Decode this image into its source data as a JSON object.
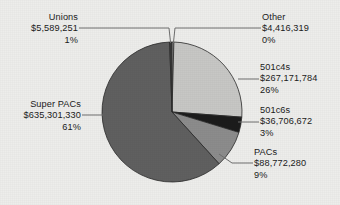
{
  "background_color": "#ededeb",
  "text_color": "#1b1b1b",
  "chart_data": {
    "type": "pie",
    "title": "",
    "subtitle": "",
    "xlabel": "",
    "ylabel": "",
    "legend_position": "none",
    "grid": false,
    "labels_show_value": true,
    "labels_show_percent": true,
    "total_value": "$1,037,957,836",
    "categories": [
      "Unions",
      "Other",
      "501c4s",
      "501c6s",
      "PACs",
      "Super PACs"
    ],
    "values": [
      5589251,
      4416319,
      267171784,
      36706672,
      88772280,
      635301330
    ],
    "percents": [
      1,
      0,
      26,
      3,
      9,
      61
    ],
    "colors": [
      "#3c3c3c",
      "#d6d6d4",
      "#c7c7c5",
      "#1c1c1c",
      "#8c8c8c",
      "#606060"
    ],
    "slices": [
      {
        "name": "other",
        "label": "Other",
        "value_text": "$4,416,319",
        "percent_text": "0%",
        "percent": 0.43,
        "color": "#d6d6d4"
      },
      {
        "name": "501c4s",
        "label": "501c4s",
        "value_text": "$267,171,784",
        "percent_text": "26%",
        "percent": 25.74,
        "color": "#c7c7c5"
      },
      {
        "name": "501c6s",
        "label": "501c6s",
        "value_text": "$36,706,672",
        "percent_text": "3%",
        "percent": 3.54,
        "color": "#1c1c1c"
      },
      {
        "name": "pacs",
        "label": "PACs",
        "value_text": "$88,772,280",
        "percent_text": "9%",
        "percent": 8.55,
        "color": "#8c8c8c"
      },
      {
        "name": "super-pacs",
        "label": "Super PACs",
        "value_text": "$635,301,330",
        "percent_text": "61%",
        "percent": 61.2,
        "color": "#606060"
      },
      {
        "name": "unions",
        "label": "Unions",
        "value_text": "$5,589,251",
        "percent_text": "1%",
        "percent": 0.54,
        "color": "#3c3c3c"
      }
    ]
  },
  "labels": {
    "unions": {
      "title": "Unions",
      "value": "$5,589,251",
      "percent": "1%"
    },
    "other": {
      "title": "Other",
      "value": "$4,416,319",
      "percent": "0%"
    },
    "c4s": {
      "title": "501c4s",
      "value": "$267,171,784",
      "percent": "26%"
    },
    "c6s": {
      "title": "501c6s",
      "value": "$36,706,672",
      "percent": "3%"
    },
    "pacs": {
      "title": "PACs",
      "value": "$88,772,280",
      "percent": "9%"
    },
    "superpacs": {
      "title": "Super PACs",
      "value": "$635,301,330",
      "percent": "61%"
    }
  }
}
